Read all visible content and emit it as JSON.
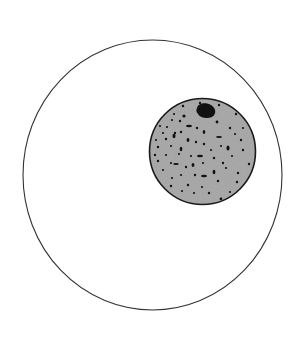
{
  "diagram": {
    "outer_circle": {
      "cx": 152.5,
      "cy": 175,
      "rx": 129.5,
      "ry": 135,
      "stroke": "#333333",
      "fill": "#ffffff"
    },
    "inner_circle": {
      "cx": 202.5,
      "cy": 151.5,
      "r": 53,
      "fill": "#9e9e9e",
      "stroke": "#1a1a1a"
    },
    "inclusion": {
      "cx": 206,
      "cy": 113,
      "rx": 10,
      "ry": 6.5,
      "fill": "#111111"
    },
    "colors": {
      "background": "#ffffff",
      "speckle": "#111111"
    }
  }
}
